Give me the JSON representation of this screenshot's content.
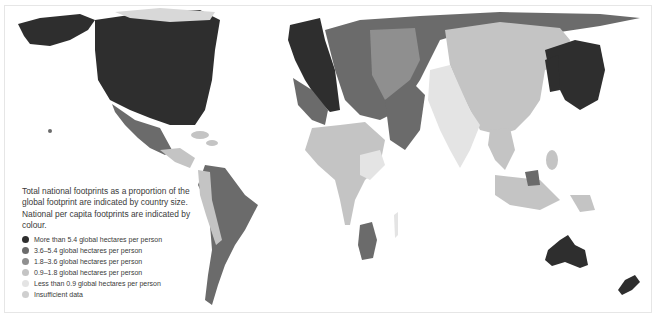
{
  "legend": {
    "title": "Total national footprints as a proportion of the global footprint are indicated by country size. National per capita footprints are indicated by colour.",
    "items": [
      {
        "label": "More than 5.4 global hectares per person",
        "color": "#2e2e2e"
      },
      {
        "label": "3.6–5.4 global hectares per person",
        "color": "#6b6b6b"
      },
      {
        "label": "1.8–3.6 global hectares per person",
        "color": "#8f8f8f"
      },
      {
        "label": "0.9–1.8 global hectares per person",
        "color": "#c4c4c4"
      },
      {
        "label": "Less than 0.9 global hectares per person",
        "color": "#e4e4e4"
      },
      {
        "label": "Insufficient data",
        "color": "#cfcfcf"
      }
    ]
  },
  "map": {
    "type": "cartogram",
    "regions": [
      {
        "name": "North America (USA/Canada)",
        "class": "More than 5.4"
      },
      {
        "name": "Mexico",
        "class": "1.8–3.6"
      },
      {
        "name": "South America",
        "class": "1.8–3.6"
      },
      {
        "name": "Western Europe",
        "class": "More than 5.4"
      },
      {
        "name": "Russia / Eastern Europe",
        "class": "3.6–5.4"
      },
      {
        "name": "Middle East",
        "class": "1.8–3.6"
      },
      {
        "name": "Africa",
        "class": "0.9–1.8"
      },
      {
        "name": "South Africa",
        "class": "1.8–3.6"
      },
      {
        "name": "China",
        "class": "0.9–1.8"
      },
      {
        "name": "India",
        "class": "Less than 0.9"
      },
      {
        "name": "Japan / Korea",
        "class": "More than 5.4"
      },
      {
        "name": "Southeast Asia",
        "class": "0.9–1.8"
      },
      {
        "name": "Australia",
        "class": "More than 5.4"
      },
      {
        "name": "New Zealand",
        "class": "More than 5.4"
      }
    ]
  }
}
